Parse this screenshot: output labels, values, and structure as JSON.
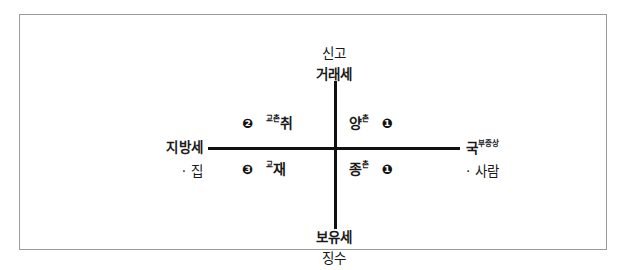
{
  "diagram": {
    "axis_labels": {
      "top_upper": "신고",
      "top_lower": "거래세",
      "bottom_upper": "보유세",
      "bottom_lower": "징수",
      "left_upper": "지방세",
      "left_lower": "· 집",
      "right_upper_base": "국",
      "right_upper_sup": "부증상",
      "right_lower": "· 사람"
    },
    "quadrants": {
      "top_left": {
        "marker": "❷",
        "superscript": "교촌",
        "term": "취"
      },
      "top_right": {
        "term": "양",
        "superscript": "촌",
        "marker": "❶"
      },
      "bottom_left": {
        "marker": "❸",
        "superscript": "교",
        "term": "재"
      },
      "bottom_right": {
        "term": "종",
        "superscript": "촌",
        "marker": "❶"
      }
    },
    "colors": {
      "axis": "#111111",
      "frame": "#9a9a9a",
      "text": "#1a1a1a",
      "background": "#ffffff"
    }
  }
}
